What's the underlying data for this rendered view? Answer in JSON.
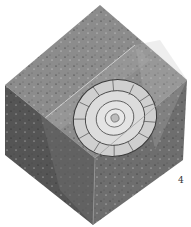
{
  "figure": {
    "plate_number": "4",
    "colors": {
      "top_face": "#8c8c8c",
      "left_face": "#555555",
      "right_face": "#6e6e6e",
      "shell_light": "#d8d8d8",
      "shell_line": "#3a3a3a"
    }
  }
}
